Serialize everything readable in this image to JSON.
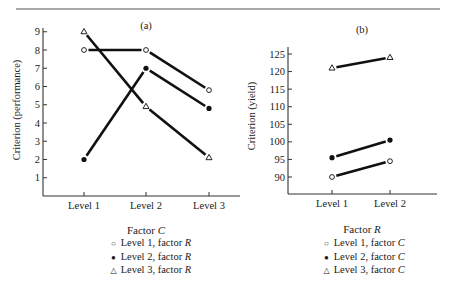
{
  "chart_data": [
    {
      "id": "a",
      "type": "line",
      "title": "(a)",
      "xlabel": "Factor C",
      "xlabel_main": "Factor",
      "xlabel_var": "C",
      "ylabel": "Criterion (performance)",
      "categories": [
        "Level 1",
        "Level 2",
        "Level 3"
      ],
      "yticks": [
        1,
        2,
        3,
        4,
        5,
        6,
        7,
        8,
        9
      ],
      "ylim": [
        0,
        9.2
      ],
      "grid": false,
      "legend_position": "below",
      "series": [
        {
          "name": "Level 1, factor R",
          "marker": "open-circle",
          "values": [
            8,
            8,
            5.8
          ]
        },
        {
          "name": "Level 2, factor R",
          "marker": "filled-circle",
          "values": [
            2,
            7,
            4.8
          ]
        },
        {
          "name": "Level 3, factor R",
          "marker": "open-triangle",
          "values": [
            9,
            4.9,
            2.1
          ]
        }
      ]
    },
    {
      "id": "b",
      "type": "line",
      "title": "(b)",
      "xlabel": "Factor R",
      "xlabel_main": "Factor",
      "xlabel_var": "R",
      "ylabel": "Criterion (yield)",
      "categories": [
        "Level 1",
        "Level 2"
      ],
      "yticks": [
        90,
        95,
        100,
        105,
        110,
        115,
        120,
        125
      ],
      "ylim": [
        86,
        127
      ],
      "grid": false,
      "legend_position": "below",
      "series": [
        {
          "name": "Level 1, factor C",
          "marker": "open-circle",
          "values": [
            90,
            94.5
          ]
        },
        {
          "name": "Level 2, factor C",
          "marker": "filled-circle",
          "values": [
            95.5,
            100.5
          ]
        },
        {
          "name": "Level 3, factor C",
          "marker": "open-triangle",
          "values": [
            121,
            124
          ]
        }
      ]
    }
  ],
  "legends": {
    "a": [
      {
        "symbol": "○",
        "prefix": "Level 1, factor ",
        "var": "R"
      },
      {
        "symbol": "●",
        "prefix": "Level 2, factor ",
        "var": "R"
      },
      {
        "symbol": "△",
        "prefix": "Level 3, factor ",
        "var": "R"
      }
    ],
    "b": [
      {
        "symbol": "○",
        "prefix": "Level 1, factor ",
        "var": "C"
      },
      {
        "symbol": "●",
        "prefix": "Level 2, factor ",
        "var": "C"
      },
      {
        "symbol": "△",
        "prefix": "Level 3, factor ",
        "var": "C"
      }
    ]
  }
}
